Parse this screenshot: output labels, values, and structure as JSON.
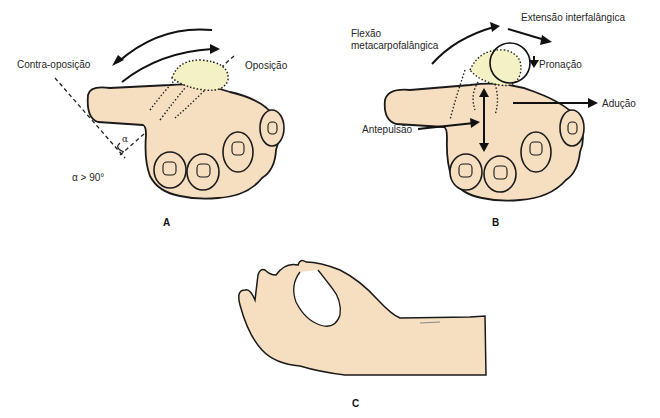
{
  "figure": {
    "panels": [
      {
        "id": "A",
        "letter": "A",
        "labels": {
          "counter_opposition": "Contra-oposição",
          "opposition": "Oposição",
          "alpha_symbol": "α",
          "alpha_condition": "α > 90°"
        }
      },
      {
        "id": "B",
        "letter": "B",
        "labels": {
          "mcp_flexion_line1": "Flexão",
          "mcp_flexion_line2": "metacarpofalângica",
          "ip_extension": "Extensão interfalângica",
          "pronation": "Pronação",
          "adduction": "Adução",
          "antepulsion": "Antepulsão"
        }
      },
      {
        "id": "C",
        "letter": "C",
        "labels": {}
      }
    ],
    "colors": {
      "skin": "#f6dfc0",
      "thumb_highlight": "#f4f2c4",
      "outline": "#1a1a1a",
      "text": "#262626"
    }
  }
}
